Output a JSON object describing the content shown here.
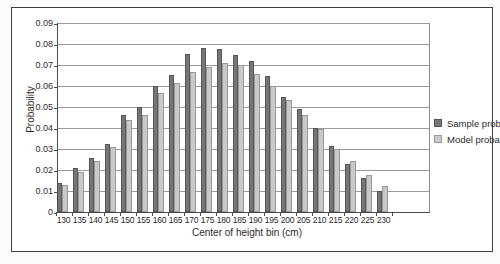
{
  "figure": {
    "background": "#ffffff",
    "frame_border_color": "#3e3e3e",
    "gridline_color": "#9b9b9b",
    "axis_color": "#4a4a4a"
  },
  "chart_data": {
    "type": "bar",
    "title": "",
    "xlabel": "Center of height bin (cm)",
    "ylabel": "Probability",
    "categories": [
      "130",
      "135",
      "140",
      "145",
      "150",
      "155",
      "160",
      "165",
      "170",
      "175",
      "180",
      "185",
      "190",
      "195",
      "200",
      "205",
      "210",
      "215",
      "220",
      "225",
      "230"
    ],
    "series": [
      {
        "name": "Sample probability",
        "color": "#767676",
        "values": [
          0.0135,
          0.0205,
          0.0255,
          0.032,
          0.046,
          0.05,
          0.06,
          0.065,
          0.075,
          0.078,
          0.0775,
          0.0745,
          0.0715,
          0.0645,
          0.0545,
          0.049,
          0.04,
          0.031,
          0.0225,
          0.016,
          0.01
        ]
      },
      {
        "name": "Model probability",
        "color": "#c9c9c9",
        "values": [
          0.0125,
          0.019,
          0.024,
          0.0305,
          0.0435,
          0.046,
          0.0565,
          0.061,
          0.0665,
          0.069,
          0.0705,
          0.07,
          0.0655,
          0.06,
          0.053,
          0.046,
          0.0395,
          0.03,
          0.024,
          0.0175,
          0.012
        ]
      }
    ],
    "ylim": [
      0,
      0.09
    ],
    "ytick_step": 0.01,
    "ytick_labels": [
      "0",
      "0.01",
      "0.02",
      "0.03",
      "0.04",
      "0.05",
      "0.06",
      "0.07",
      "0.08",
      "0.09"
    ],
    "grid": "horizontal",
    "legend_position": "right"
  }
}
